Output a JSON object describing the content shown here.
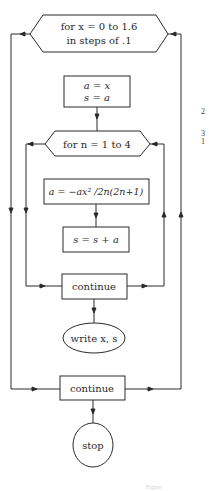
{
  "diagram": {
    "type": "flowchart",
    "nodes": {
      "outer_loop": {
        "line1": "for x = 0 to 1.6",
        "line2": "in steps of .1"
      },
      "init": {
        "line1": "a = x",
        "line2": "s = a"
      },
      "inner_loop": {
        "label": "for n = 1 to 4"
      },
      "update_a": {
        "label": "a = −ax² /2n(2n+1)"
      },
      "update_s": {
        "label": "s = s + a"
      },
      "inner_continue": {
        "label": "continue"
      },
      "write": {
        "label": "write x, s"
      },
      "outer_continue": {
        "label": "continue"
      },
      "stop": {
        "label": "stop"
      }
    },
    "margin_numbers": [
      "2",
      "3",
      "1"
    ],
    "caption": "Figure"
  },
  "colors": {
    "line": "#2b2b2b",
    "text": "#2a2a2a",
    "background": "#ffffff"
  }
}
